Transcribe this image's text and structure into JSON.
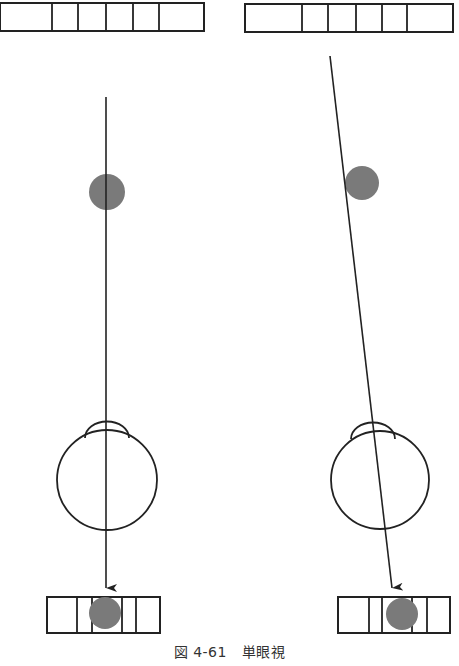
{
  "figure": {
    "caption_number": "図 4-61",
    "caption_title": "単眼視",
    "colors": {
      "stroke": "#222222",
      "dot": "#7a7a7a",
      "caption": "#333333",
      "background": "#ffffff"
    }
  },
  "panels": [
    {
      "side": "left",
      "description": "Eye looking straight at the object; object image falls on the center of the retina strip",
      "top_strip": {
        "x": 0,
        "y": 3,
        "width": 204,
        "height": 28,
        "dividers": [
          52,
          78,
          106,
          133,
          159
        ]
      },
      "object_dot": {
        "cx": 107,
        "cy": 192,
        "r": 18
      },
      "line_of_sight": {
        "x1": 106,
        "y1": 97,
        "x2": 106,
        "y2": 588
      },
      "eye": {
        "cx": 107,
        "cy": 480,
        "r": 50,
        "cornea_cx": 107,
        "cornea_top": 423
      },
      "bottom_strip": {
        "x": 47,
        "y": 597,
        "width": 113,
        "height": 36,
        "dividers": [
          77,
          92,
          122,
          136
        ]
      },
      "image_dot": {
        "cx": 105,
        "cy": 613,
        "r": 16
      }
    },
    {
      "side": "right",
      "description": "Object off the line of sight; the line is tilted and the image falls at an offset on the retina strip",
      "top_strip": {
        "x": 245,
        "y": 4,
        "width": 208,
        "height": 28,
        "dividers": [
          302,
          328,
          356,
          382,
          407
        ]
      },
      "object_dot": {
        "cx": 362,
        "cy": 183,
        "r": 17
      },
      "line_of_sight": {
        "x1": 330,
        "y1": 56,
        "x2": 392,
        "y2": 588
      },
      "eye": {
        "cx": 380,
        "cy": 480,
        "r": 49,
        "cornea_cx": 373,
        "cornea_top": 423
      },
      "bottom_strip": {
        "x": 338,
        "y": 597,
        "width": 112,
        "height": 36,
        "dividers": [
          369,
          382,
          412,
          427
        ]
      },
      "image_dot": {
        "cx": 402,
        "cy": 614,
        "r": 16
      }
    }
  ]
}
